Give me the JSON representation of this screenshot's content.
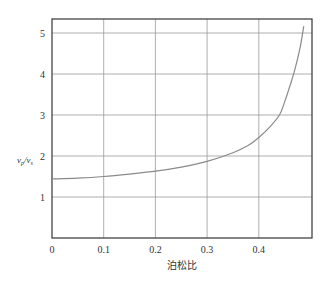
{
  "chart_data": {
    "type": "line",
    "title": "",
    "xlabel": "泊松比",
    "ylabel": "v_p/v_s",
    "ylabel_main": "v",
    "ylabel_sub1": "p",
    "ylabel_sub2": "s",
    "xlim": [
      0,
      0.5
    ],
    "ylim": [
      0,
      5.3
    ],
    "grid": true,
    "legend": null,
    "x_ticks": [
      "0",
      "0.1",
      "0.2",
      "0.3",
      "0.4"
    ],
    "y_ticks": [
      "1",
      "2",
      "3",
      "4",
      "5"
    ],
    "series": [
      {
        "name": "vp/vs vs Poisson's ratio",
        "color": "#8a8a8a",
        "x": [
          0.0,
          0.05,
          0.1,
          0.15,
          0.2,
          0.25,
          0.3,
          0.35,
          0.38,
          0.4,
          0.42,
          0.44,
          0.45,
          0.46,
          0.47,
          0.48,
          0.487
        ],
        "y": [
          1.44,
          1.46,
          1.5,
          1.56,
          1.63,
          1.73,
          1.87,
          2.08,
          2.26,
          2.45,
          2.69,
          3.0,
          3.32,
          3.7,
          4.12,
          4.65,
          5.17
        ]
      }
    ]
  }
}
